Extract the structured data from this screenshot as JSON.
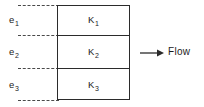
{
  "diagram": {
    "type": "stratified-layer-flow-diagram",
    "layers": [
      {
        "thickness_label": "e",
        "thickness_sub": "1",
        "conductivity_label": "K",
        "conductivity_sub": "1"
      },
      {
        "thickness_label": "e",
        "thickness_sub": "2",
        "conductivity_label": "K",
        "conductivity_sub": "2"
      },
      {
        "thickness_label": "e",
        "thickness_sub": "3",
        "conductivity_label": "K",
        "conductivity_sub": "3"
      }
    ],
    "annotation": {
      "flow_label": "Flow",
      "arrow_direction": "right"
    },
    "colors": {
      "outline": "#2b2b2b",
      "dashed": "#4a4a4a",
      "text": "#1b1b1b",
      "background": "#ffffff"
    }
  }
}
